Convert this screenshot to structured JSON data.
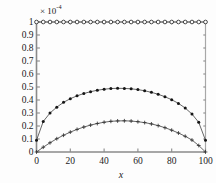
{
  "chart_data": {
    "type": "line",
    "title": "",
    "xlabel": "x",
    "ylabel": "",
    "y_exponent_label": "× 10",
    "y_exponent_value": "-4",
    "xlim": [
      0,
      100
    ],
    "ylim": [
      0,
      1
    ],
    "xticks": [
      0,
      20,
      40,
      60,
      80,
      100
    ],
    "xtick_labels": [
      "0",
      "20",
      "40",
      "60",
      "80",
      "100"
    ],
    "yticks": [
      0,
      0.1,
      0.2,
      0.3,
      0.4,
      0.5,
      0.6,
      0.7,
      0.8,
      0.9,
      1
    ],
    "ytick_labels": [
      "0",
      "0.1",
      "0.2",
      "0.3",
      "0.4",
      "0.5",
      "0.6",
      "0.7",
      "0.8",
      "0.9",
      "1"
    ],
    "grid": false,
    "legend": null,
    "legend_position": "none",
    "series": [
      {
        "name": "series-top-constant",
        "marker": "open-circle",
        "line": "solid",
        "color": "#333333",
        "x": [
          0,
          4,
          8,
          12,
          16,
          20,
          24,
          28,
          32,
          36,
          40,
          44,
          48,
          52,
          56,
          60,
          64,
          68,
          72,
          76,
          80,
          84,
          88,
          92,
          96,
          100
        ],
        "values": [
          1,
          1,
          1,
          1,
          1,
          1,
          1,
          1,
          1,
          1,
          1,
          1,
          1,
          1,
          1,
          1,
          1,
          1,
          1,
          1,
          1,
          1,
          1,
          1,
          1,
          1
        ]
      },
      {
        "name": "series-middle-dot",
        "marker": "filled-dot",
        "line": "solid",
        "color": "#151515",
        "x": [
          0,
          4,
          8,
          12,
          16,
          20,
          24,
          28,
          32,
          36,
          40,
          44,
          48,
          52,
          56,
          60,
          64,
          68,
          72,
          76,
          80,
          84,
          88,
          92,
          96,
          100
        ],
        "values": [
          0.09,
          0.235,
          0.3,
          0.345,
          0.382,
          0.41,
          0.432,
          0.45,
          0.464,
          0.475,
          0.483,
          0.488,
          0.49,
          0.489,
          0.486,
          0.48,
          0.471,
          0.459,
          0.444,
          0.425,
          0.402,
          0.374,
          0.338,
          0.292,
          0.228,
          0.09
        ]
      },
      {
        "name": "series-lower-plus",
        "marker": "plus",
        "line": "solid",
        "color": "#333333",
        "x": [
          0,
          4,
          8,
          12,
          16,
          20,
          24,
          28,
          32,
          36,
          40,
          44,
          48,
          52,
          56,
          60,
          64,
          68,
          72,
          76,
          80,
          84,
          88,
          92,
          96,
          100
        ],
        "values": [
          0.0,
          0.037,
          0.071,
          0.102,
          0.129,
          0.153,
          0.174,
          0.192,
          0.207,
          0.219,
          0.229,
          0.236,
          0.239,
          0.24,
          0.238,
          0.233,
          0.226,
          0.216,
          0.203,
          0.187,
          0.168,
          0.146,
          0.121,
          0.092,
          0.05,
          0.0
        ]
      }
    ]
  }
}
